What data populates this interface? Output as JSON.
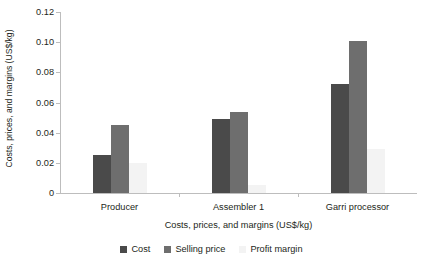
{
  "chart_data": {
    "type": "bar",
    "title": "",
    "subtitle": "",
    "xlabel": "Costs, prices, and margins (US$/kg)",
    "ylabel": "Costs, prices, and margins (US$/kg)",
    "categories": [
      "Producer",
      "Assembler 1",
      "Garri processor"
    ],
    "series": [
      {
        "name": "Cost",
        "color": "#4a4a4a",
        "values": [
          0.025,
          0.049,
          0.072
        ]
      },
      {
        "name": "Selling price",
        "color": "#6e6e6e",
        "values": [
          0.045,
          0.054,
          0.101
        ]
      },
      {
        "name": "Profit margin",
        "color": "#f3f3f3",
        "values": [
          0.02,
          0.005,
          0.029
        ]
      }
    ],
    "ylim": [
      0,
      0.12
    ],
    "ytick_values": [
      0,
      0.02,
      0.04,
      0.06,
      0.08,
      0.1,
      0.12
    ],
    "ytick_labels": [
      "0",
      "0.02",
      "0.04",
      "0.06",
      "0.08",
      "0.10",
      "0.12"
    ],
    "grid": false,
    "legend_position": "bottom",
    "legend_entries": [
      "Cost",
      "Selling price",
      "Profit margin"
    ]
  }
}
